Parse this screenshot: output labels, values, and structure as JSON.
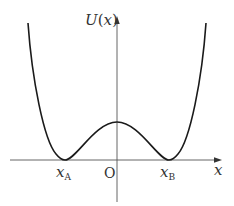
{
  "diagram": {
    "type": "potential-energy-curve",
    "y_axis_label_func": "U",
    "y_axis_label_open": "(",
    "y_axis_label_var": "x",
    "y_axis_label_close": ")",
    "x_axis_label": "x",
    "origin_label": "O",
    "minimum_left_base": "x",
    "minimum_left_sub": "A",
    "minimum_right_base": "x",
    "minimum_right_sub": "B",
    "colors": {
      "curve": "#1a1a1a",
      "axis": "#444444",
      "text": "#333333"
    }
  }
}
